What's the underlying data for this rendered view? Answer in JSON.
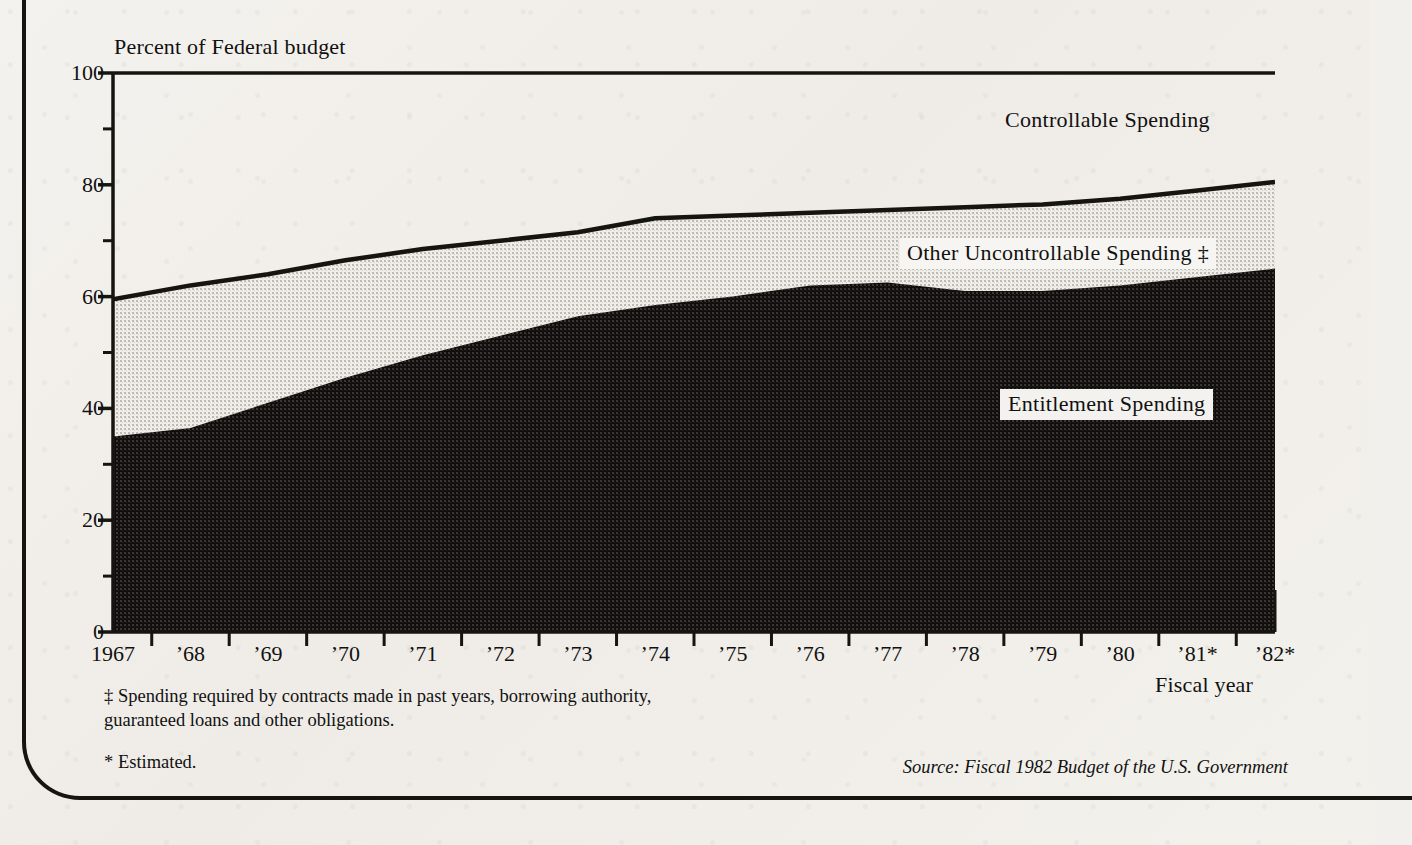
{
  "chart_data": {
    "type": "area",
    "title": "",
    "ylabel": "Percent of Federal budget",
    "xlabel": "Fiscal year",
    "ylim": [
      0,
      100
    ],
    "yticks": [
      0,
      20,
      40,
      60,
      80,
      100
    ],
    "yticks_minor": [
      10,
      30,
      50,
      70,
      90
    ],
    "grid": false,
    "stacked": true,
    "legend_position": "in-plot annotations",
    "categories": [
      "1967",
      "1968",
      "1969",
      "1970",
      "1971",
      "1972",
      "1973",
      "1974",
      "1975",
      "1976",
      "1977",
      "1978",
      "1979",
      "1980",
      "1981",
      "1982"
    ],
    "tick_labels": [
      "1967",
      "’68",
      "’69",
      "’70",
      "’71",
      "’72",
      "’73",
      "’74",
      "’75",
      "’76",
      "’77",
      "’78",
      "’79",
      "’80",
      "’81*",
      "’82*"
    ],
    "series": [
      {
        "name": "Entitlement Spending",
        "values": [
          35.0,
          36.5,
          41.0,
          45.5,
          49.5,
          53.0,
          56.5,
          58.5,
          60.0,
          62.0,
          62.5,
          61.0,
          61.0,
          62.0,
          63.5,
          65.0
        ]
      },
      {
        "name": "Other Uncontrollable Spending ‡",
        "values": [
          24.5,
          25.5,
          23.0,
          21.0,
          19.0,
          17.0,
          15.0,
          15.5,
          14.5,
          13.0,
          13.0,
          15.0,
          15.5,
          15.5,
          15.5,
          15.5
        ]
      },
      {
        "name": "Controllable Spending",
        "values": [
          40.5,
          38.0,
          36.0,
          33.5,
          31.5,
          30.0,
          28.5,
          26.0,
          25.5,
          25.0,
          24.5,
          24.0,
          23.5,
          22.5,
          21.0,
          19.5
        ]
      }
    ],
    "cumulative_entitlement": [
      35.0,
      36.5,
      41.0,
      45.5,
      49.5,
      53.0,
      56.5,
      58.5,
      60.0,
      62.0,
      62.5,
      61.0,
      61.0,
      62.0,
      63.5,
      65.0
    ],
    "cumulative_uncontrollable": [
      59.5,
      62.0,
      64.0,
      66.5,
      68.5,
      70.0,
      71.5,
      74.0,
      74.5,
      75.0,
      75.5,
      76.0,
      76.5,
      77.5,
      79.0,
      80.5
    ]
  },
  "labels": {
    "y_axis_title": "Percent of Federal budget",
    "x_axis_title": "Fiscal year",
    "controllable": "Controllable Spending",
    "other_uncontrollable": "Other Uncontrollable Spending ‡",
    "entitlement": "Entitlement Spending"
  },
  "footnotes": {
    "dagger": "‡ Spending required by contracts made in past years, borrowing authority,\n   guaranteed loans and other obligations.",
    "estimated": "* Estimated.",
    "source": "Source: Fiscal 1982 Budget of the U.S. Government"
  },
  "colors": {
    "ink": "#16140f",
    "paper": "#f2f0ec",
    "entitlement_fill": "#141210",
    "uncontrollable_fill": "#d9d7d2",
    "controllable_fill": "#f2f0ec"
  }
}
